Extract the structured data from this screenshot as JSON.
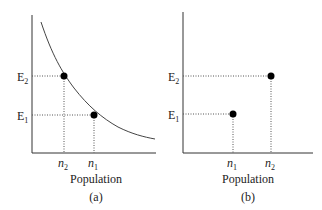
{
  "panel_a": {
    "caption": "(a)",
    "xlabel": "Population",
    "y_ticks": [
      {
        "label": "E",
        "sub": "2",
        "y": 76
      },
      {
        "label": "E",
        "sub": "1",
        "y": 115
      }
    ],
    "x_ticks": [
      {
        "label": "n",
        "sub": "2",
        "x": 64
      },
      {
        "label": "n",
        "sub": "1",
        "x": 94
      }
    ],
    "curve": "decreasing convex curve",
    "points": [
      {
        "name": "(n2, E2)",
        "x": 64,
        "y": 76
      },
      {
        "name": "(n1, E1)",
        "x": 94,
        "y": 115
      }
    ]
  },
  "panel_b": {
    "caption": "(b)",
    "xlabel": "Population",
    "y_ticks": [
      {
        "label": "E",
        "sub": "2",
        "y": 76
      },
      {
        "label": "E",
        "sub": "1",
        "y": 114
      }
    ],
    "x_ticks": [
      {
        "label": "n",
        "sub": "1",
        "x": 233
      },
      {
        "label": "n",
        "sub": "2",
        "x": 271
      }
    ],
    "points": [
      {
        "name": "(n1, E1)",
        "x": 233,
        "y": 114
      },
      {
        "name": "(n2, E2)",
        "x": 271,
        "y": 76
      }
    ]
  },
  "colors": {
    "axis": "#333333",
    "curve": "#444444",
    "point": "#000000",
    "guide": "#555555"
  }
}
